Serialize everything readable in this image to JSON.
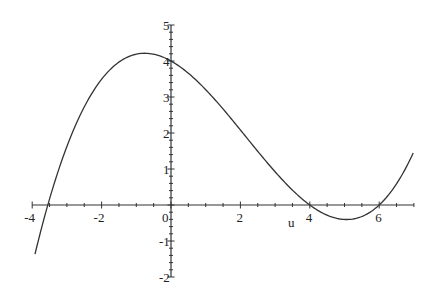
{
  "chart_data": {
    "type": "line",
    "title": "",
    "xlabel": "u",
    "ylabel": "",
    "xlim": [
      -4,
      7
    ],
    "ylim": [
      -2,
      5
    ],
    "grid": false,
    "legend": null,
    "x_ticks": [
      -4,
      -2,
      0,
      2,
      4,
      6
    ],
    "x_tick_labels": [
      "-4",
      "-2",
      "0",
      "2",
      "4",
      "6"
    ],
    "y_ticks": [
      -2,
      -1,
      1,
      2,
      3,
      4,
      5
    ],
    "y_tick_labels": [
      "-2",
      "-1",
      "1",
      "2",
      "3",
      "4",
      "5"
    ],
    "series": [
      {
        "name": "f(u)",
        "color": "#333333",
        "x": [
          -4,
          -3.5,
          -3,
          -2.5,
          -2,
          -1.5,
          -1,
          -0.5,
          0,
          0.5,
          1,
          1.5,
          2,
          2.5,
          3,
          3.5,
          4,
          4.5,
          5,
          5.5,
          6,
          6.5,
          7
        ],
        "y": [
          -1.9,
          0.15,
          1.67,
          2.78,
          3.52,
          3.96,
          4.16,
          4.15,
          4.0,
          3.72,
          3.34,
          2.87,
          2.33,
          1.75,
          1.15,
          0.56,
          0.0,
          -0.45,
          -0.44,
          -0.28,
          0.0,
          0.62,
          1.5
        ]
      }
    ],
    "annotations": []
  },
  "axes": {
    "x_axis_label": "u",
    "origin_label": "0"
  }
}
